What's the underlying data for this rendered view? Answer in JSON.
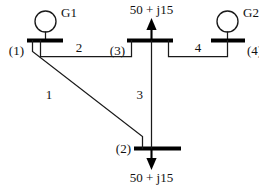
{
  "diagram": {
    "colors": {
      "background": "#ffffff",
      "line": "#1a1a1a",
      "bus": "#000000",
      "text": "#111111"
    }
  },
  "generators": [
    {
      "id": "G1",
      "label": "G1",
      "bus": "(1)"
    },
    {
      "id": "G2",
      "label": "G2",
      "bus": "(4)"
    }
  ],
  "buses": [
    {
      "id": "bus1",
      "label": "(1)"
    },
    {
      "id": "bus2",
      "label": "(2)"
    },
    {
      "id": "bus3",
      "label": "(3)"
    },
    {
      "id": "bus4",
      "label": "(4)"
    }
  ],
  "lines": [
    {
      "id": "line1",
      "label": "1",
      "from": "(1)",
      "to": "(2)"
    },
    {
      "id": "line2",
      "label": "2",
      "from": "(1)",
      "to": "(3)"
    },
    {
      "id": "line3",
      "label": "3",
      "from": "(3)",
      "to": "(2)"
    },
    {
      "id": "line4",
      "label": "4",
      "from": "(3)",
      "to": "(4)"
    }
  ],
  "loads": [
    {
      "id": "load-bus3",
      "bus": "(3)",
      "label": "50 + j15",
      "direction": "up"
    },
    {
      "id": "load-bus2",
      "bus": "(2)",
      "label": "50 + j15",
      "direction": "down"
    }
  ]
}
